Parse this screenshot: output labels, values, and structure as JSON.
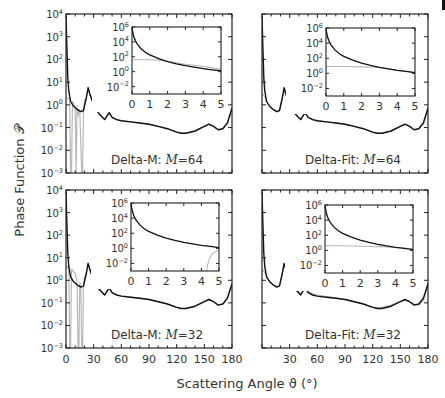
{
  "figure": {
    "ylabel": "Phase Function 𝒫",
    "xlabel": "Scattering Angle ϑ (°)",
    "colors": {
      "exact": "#111111",
      "approx": "#b8b8b8",
      "axis": "#222222",
      "bg": "#ffffff"
    }
  },
  "chart_data": [
    {
      "type": "line",
      "panel": "top-left",
      "title": "Delta-M: M=64",
      "label_prefix": "Delta-M:",
      "label_M": "M=64",
      "xlabel": "",
      "ylabel": "Phase Function",
      "xlim": [
        0,
        180
      ],
      "ylim_log10": [
        -3,
        4
      ],
      "yscale": "log",
      "yticks": [
        "10^-3",
        "10^-2",
        "10^-1",
        "10^0",
        "10^1",
        "10^2",
        "10^3",
        "10^4"
      ],
      "xticks": [],
      "series": [
        {
          "name": "exact",
          "x": [
            0,
            1,
            2,
            3,
            5,
            8,
            12,
            16,
            19,
            22,
            24,
            26,
            30,
            36,
            42,
            45,
            47,
            50,
            55,
            60,
            70,
            80,
            90,
            100,
            110,
            120,
            125,
            130,
            140,
            150,
            155,
            160,
            165,
            170,
            175,
            180
          ],
          "log10y": [
            3.9,
            2.5,
            1.2,
            0.6,
            0.15,
            -0.05,
            -0.2,
            -0.3,
            -0.25,
            0.3,
            0.75,
            0.45,
            0.0,
            -0.4,
            -0.65,
            -0.45,
            -0.35,
            -0.55,
            -0.65,
            -0.7,
            -0.75,
            -0.8,
            -0.85,
            -0.95,
            -1.05,
            -1.2,
            -1.25,
            -1.25,
            -1.15,
            -0.95,
            -0.85,
            -0.95,
            -1.1,
            -1.05,
            -0.8,
            -0.15
          ]
        },
        {
          "name": "approx",
          "x": [
            0,
            2,
            4,
            5,
            6,
            7,
            8,
            10,
            11,
            12,
            13,
            14,
            15,
            17,
            18,
            19,
            20,
            22,
            24,
            26,
            30,
            36,
            42,
            45,
            47,
            50,
            55,
            60,
            70,
            80,
            90,
            100,
            110,
            120,
            125,
            130,
            140,
            150,
            155,
            160,
            165,
            170,
            175,
            180
          ],
          "log10y": [
            0.3,
            0.3,
            0.2,
            -3,
            -3,
            0.15,
            0.1,
            -0.1,
            -3,
            -0.05,
            -0.5,
            -0.2,
            -0.3,
            -3,
            -3,
            -0.3,
            0.2,
            0.3,
            0.75,
            0.45,
            0.0,
            -0.4,
            -0.65,
            -0.45,
            -0.35,
            -0.55,
            -0.65,
            -0.7,
            -0.75,
            -0.8,
            -0.85,
            -0.95,
            -1.05,
            -1.2,
            -1.25,
            -1.25,
            -1.15,
            -0.95,
            -0.85,
            -0.95,
            -1.1,
            -1.05,
            -0.8,
            -0.15
          ]
        }
      ],
      "inset": {
        "xlim": [
          0,
          5
        ],
        "ylim_log10": [
          -3,
          6
        ],
        "xticks": [
          "0",
          "1",
          "2",
          "3",
          "4",
          "5"
        ],
        "yticks": [
          "10^-2",
          "10^0",
          "10^2",
          "10^4",
          "10^6"
        ],
        "series": [
          {
            "name": "exact",
            "x": [
              0,
              0.05,
              0.1,
              0.2,
              0.3,
              0.5,
              0.75,
              1,
              1.5,
              2,
              2.5,
              3,
              3.5,
              4,
              4.5,
              5
            ],
            "log10y": [
              5.9,
              5.2,
              4.7,
              4.1,
              3.7,
              3.1,
              2.6,
              2.25,
              1.75,
              1.35,
              1.05,
              0.8,
              0.6,
              0.4,
              0.25,
              0.1
            ]
          },
          {
            "name": "approx",
            "x": [
              0,
              1,
              1.5,
              2,
              2.5,
              3,
              3.5,
              4,
              4.5,
              5
            ],
            "log10y": [
              1.6,
              1.6,
              1.55,
              1.4,
              1.2,
              1.0,
              0.85,
              0.7,
              0.5,
              0.3
            ]
          }
        ]
      }
    },
    {
      "type": "line",
      "panel": "top-right",
      "title": "Delta-Fit: M=64",
      "label_prefix": "Delta-Fit:",
      "label_M": "M=64",
      "xlim": [
        0,
        180
      ],
      "ylim_log10": [
        -3,
        4
      ],
      "yscale": "log",
      "series": [
        {
          "name": "exact",
          "x": [
            0,
            1,
            2,
            3,
            5,
            8,
            12,
            16,
            19,
            22,
            24,
            26,
            30,
            36,
            42,
            45,
            47,
            50,
            55,
            60,
            70,
            80,
            90,
            100,
            110,
            120,
            125,
            130,
            140,
            150,
            155,
            160,
            165,
            170,
            175,
            180
          ],
          "log10y": [
            3.9,
            2.5,
            1.2,
            0.6,
            0.15,
            -0.05,
            -0.2,
            -0.3,
            -0.25,
            0.3,
            0.75,
            0.45,
            0.0,
            -0.4,
            -0.65,
            -0.45,
            -0.35,
            -0.55,
            -0.65,
            -0.7,
            -0.75,
            -0.8,
            -0.85,
            -0.95,
            -1.05,
            -1.2,
            -1.25,
            -1.25,
            -1.15,
            -0.95,
            -0.85,
            -0.95,
            -1.1,
            -1.05,
            -0.8,
            -0.15
          ]
        },
        {
          "name": "approx",
          "x": [
            0,
            1,
            2,
            3,
            5,
            8,
            12,
            16,
            19,
            22,
            24,
            26,
            30,
            36,
            42,
            45,
            47,
            50,
            55,
            60,
            70,
            80,
            90,
            100,
            110,
            120,
            125,
            130,
            140,
            150,
            155,
            160,
            165,
            170,
            175,
            180
          ],
          "log10y": [
            0.5,
            0.45,
            0.4,
            0.35,
            0.15,
            -0.05,
            -0.2,
            -0.3,
            -0.25,
            0.3,
            0.75,
            0.45,
            0.0,
            -0.4,
            -0.65,
            -0.45,
            -0.35,
            -0.55,
            -0.65,
            -0.7,
            -0.75,
            -0.8,
            -0.85,
            -0.95,
            -1.05,
            -1.2,
            -1.25,
            -1.25,
            -1.15,
            -0.95,
            -0.85,
            -0.95,
            -1.1,
            -1.05,
            -0.8,
            -0.15
          ]
        }
      ],
      "inset": {
        "xlim": [
          0,
          5
        ],
        "ylim_log10": [
          -3,
          6
        ],
        "xticks": [
          "0",
          "1",
          "2",
          "3",
          "4",
          "5"
        ],
        "yticks": [
          "10^-2",
          "10^0",
          "10^2",
          "10^4",
          "10^6"
        ],
        "series": [
          {
            "name": "exact",
            "x": [
              0,
              0.05,
              0.1,
              0.2,
              0.3,
              0.5,
              0.75,
              1,
              1.5,
              2,
              2.5,
              3,
              3.5,
              4,
              4.5,
              5
            ],
            "log10y": [
              5.9,
              5.2,
              4.7,
              4.1,
              3.7,
              3.1,
              2.6,
              2.25,
              1.75,
              1.35,
              1.05,
              0.8,
              0.6,
              0.4,
              0.25,
              0.1
            ]
          },
          {
            "name": "approx",
            "x": [
              0,
              1,
              2,
              3,
              3.5,
              4,
              4.5,
              5
            ],
            "log10y": [
              0.9,
              0.9,
              0.85,
              0.8,
              0.6,
              0.4,
              0.25,
              0.1
            ]
          }
        ]
      }
    },
    {
      "type": "line",
      "panel": "bottom-left",
      "title": "Delta-M: M=32",
      "label_prefix": "Delta-M:",
      "label_M": "M=32",
      "xlim": [
        0,
        180
      ],
      "ylim_log10": [
        -3,
        4
      ],
      "yscale": "log",
      "xticks": [
        "0",
        "30",
        "60",
        "90",
        "120",
        "150",
        "180"
      ],
      "series": [
        {
          "name": "exact",
          "x": [
            0,
            1,
            2,
            3,
            5,
            8,
            12,
            16,
            19,
            22,
            24,
            26,
            30,
            36,
            42,
            45,
            47,
            50,
            55,
            60,
            70,
            80,
            90,
            100,
            110,
            120,
            125,
            130,
            140,
            150,
            155,
            160,
            165,
            170,
            175,
            180
          ],
          "log10y": [
            3.9,
            2.5,
            1.2,
            0.6,
            0.15,
            -0.05,
            -0.2,
            -0.3,
            -0.25,
            0.3,
            0.75,
            0.45,
            0.0,
            -0.4,
            -0.65,
            -0.45,
            -0.35,
            -0.55,
            -0.65,
            -0.7,
            -0.75,
            -0.8,
            -0.85,
            -0.95,
            -1.05,
            -1.2,
            -1.25,
            -1.25,
            -1.15,
            -0.95,
            -0.85,
            -0.95,
            -1.1,
            -1.05,
            -0.8,
            -0.15
          ]
        },
        {
          "name": "approx",
          "x": [
            0,
            2,
            3,
            4,
            5,
            6,
            8,
            10,
            11,
            12,
            13,
            14,
            15,
            16,
            17,
            18,
            19,
            20,
            22,
            24,
            26,
            30,
            36,
            42,
            45,
            47,
            50,
            55,
            60,
            70,
            80,
            90,
            100,
            110,
            120,
            125,
            130,
            140,
            150,
            155,
            160,
            165,
            170,
            175,
            180
          ],
          "log10y": [
            0.6,
            0.6,
            0.5,
            -3,
            -3,
            0.5,
            0.4,
            0.3,
            0.1,
            -0.05,
            -3,
            -3,
            -0.1,
            -0.2,
            -3,
            -3,
            -0.3,
            0.1,
            0.3,
            0.75,
            0.45,
            0.0,
            -0.4,
            -0.65,
            -0.45,
            -0.35,
            -0.55,
            -0.65,
            -0.7,
            -0.75,
            -0.8,
            -0.85,
            -0.95,
            -1.05,
            -1.2,
            -1.25,
            -1.25,
            -1.15,
            -0.95,
            -0.85,
            -0.95,
            -1.1,
            -1.05,
            -0.8,
            -0.15
          ]
        }
      ],
      "inset": {
        "xlim": [
          0,
          5
        ],
        "ylim_log10": [
          -3,
          6
        ],
        "xticks": [
          "0",
          "1",
          "2",
          "3",
          "4",
          "5"
        ],
        "yticks": [
          "10^-2",
          "10^0",
          "10^2",
          "10^4",
          "10^6"
        ],
        "series": [
          {
            "name": "exact",
            "x": [
              0,
              0.05,
              0.1,
              0.2,
              0.3,
              0.5,
              0.75,
              1,
              1.5,
              2,
              2.5,
              3,
              3.5,
              4,
              4.5,
              5
            ],
            "log10y": [
              5.9,
              5.2,
              4.7,
              4.1,
              3.7,
              3.1,
              2.6,
              2.25,
              1.75,
              1.35,
              1.05,
              0.8,
              0.6,
              0.4,
              0.25,
              0.1
            ]
          },
          {
            "name": "approx",
            "x": [
              4.3,
              4.35,
              4.45,
              4.6,
              4.75,
              4.9,
              5
            ],
            "log10y": [
              -3,
              -2.2,
              -1.4,
              -0.8,
              -0.5,
              -0.3,
              -0.2
            ]
          }
        ]
      }
    },
    {
      "type": "line",
      "panel": "bottom-right",
      "title": "Delta-Fit: M=32",
      "label_prefix": "Delta-Fit:",
      "label_M": "M=32",
      "xlim": [
        0,
        180
      ],
      "ylim_log10": [
        -3,
        4
      ],
      "yscale": "log",
      "xticks": [
        "30",
        "60",
        "90",
        "120",
        "150",
        "180"
      ],
      "series": [
        {
          "name": "exact",
          "x": [
            0,
            1,
            2,
            3,
            5,
            8,
            12,
            16,
            19,
            22,
            24,
            26,
            30,
            36,
            42,
            45,
            47,
            50,
            55,
            60,
            70,
            80,
            90,
            100,
            110,
            120,
            125,
            130,
            140,
            150,
            155,
            160,
            165,
            170,
            175,
            180
          ],
          "log10y": [
            3.9,
            2.5,
            1.2,
            0.6,
            0.15,
            -0.05,
            -0.2,
            -0.3,
            -0.25,
            0.3,
            0.75,
            0.45,
            0.0,
            -0.4,
            -0.65,
            -0.45,
            -0.35,
            -0.55,
            -0.65,
            -0.7,
            -0.75,
            -0.8,
            -0.85,
            -0.95,
            -1.05,
            -1.2,
            -1.25,
            -1.25,
            -1.15,
            -0.95,
            -0.85,
            -0.95,
            -1.1,
            -1.05,
            -0.8,
            -0.15
          ]
        },
        {
          "name": "approx",
          "x": [
            0,
            1,
            2,
            3,
            5,
            8,
            12,
            16,
            19,
            22,
            24,
            26,
            30,
            36,
            42,
            45,
            47,
            50,
            55,
            60,
            70,
            80,
            90,
            100,
            110,
            120,
            125,
            130,
            140,
            150,
            155,
            160,
            165,
            170,
            175,
            180
          ],
          "log10y": [
            0.5,
            0.45,
            0.4,
            0.35,
            0.15,
            -0.05,
            -0.2,
            -0.3,
            -0.25,
            0.3,
            0.7,
            0.5,
            0.05,
            -0.35,
            -0.6,
            -0.45,
            -0.35,
            -0.5,
            -0.6,
            -0.65,
            -0.72,
            -0.78,
            -0.85,
            -0.95,
            -1.05,
            -1.18,
            -1.22,
            -1.2,
            -1.1,
            -0.95,
            -0.88,
            -0.95,
            -1.05,
            -1.1,
            -0.9,
            -0.2
          ]
        }
      ],
      "inset": {
        "xlim": [
          0,
          5
        ],
        "ylim_log10": [
          -3,
          6
        ],
        "xticks": [
          "0",
          "1",
          "2",
          "3",
          "4",
          "5"
        ],
        "yticks": [
          "10^-2",
          "10^0",
          "10^2",
          "10^4",
          "10^6"
        ],
        "series": [
          {
            "name": "exact",
            "x": [
              0,
              0.05,
              0.1,
              0.2,
              0.3,
              0.5,
              0.75,
              1,
              1.5,
              2,
              2.5,
              3,
              3.5,
              4,
              4.5,
              5
            ],
            "log10y": [
              5.9,
              5.2,
              4.7,
              4.1,
              3.7,
              3.1,
              2.6,
              2.25,
              1.75,
              1.35,
              1.05,
              0.8,
              0.6,
              0.4,
              0.25,
              0.1
            ]
          },
          {
            "name": "approx",
            "x": [
              0,
              1,
              2,
              3,
              4,
              5
            ],
            "log10y": [
              0.6,
              0.6,
              0.55,
              0.5,
              0.4,
              0.2
            ]
          }
        ]
      }
    }
  ]
}
